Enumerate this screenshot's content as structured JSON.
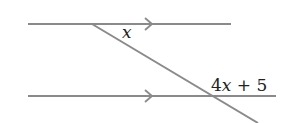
{
  "diagram": {
    "type": "parallel-lines-transversal",
    "colors": {
      "line": "#8a8a8a",
      "text": "#222222"
    },
    "lines": [
      {
        "name": "top-parallel-line",
        "x1": 28,
        "y1": 24,
        "x2": 231,
        "y2": 24,
        "arrow_x": 152
      },
      {
        "name": "bottom-parallel-line",
        "x1": 28,
        "y1": 96,
        "x2": 276,
        "y2": 96,
        "arrow_x": 152
      },
      {
        "name": "transversal",
        "x1": 92,
        "y1": 24,
        "x2": 258,
        "y2": 123
      }
    ],
    "labels": {
      "angle_top": {
        "var": "x"
      },
      "angle_bottom": {
        "coef": "4",
        "var": "x",
        "rest": " + 5"
      }
    }
  }
}
